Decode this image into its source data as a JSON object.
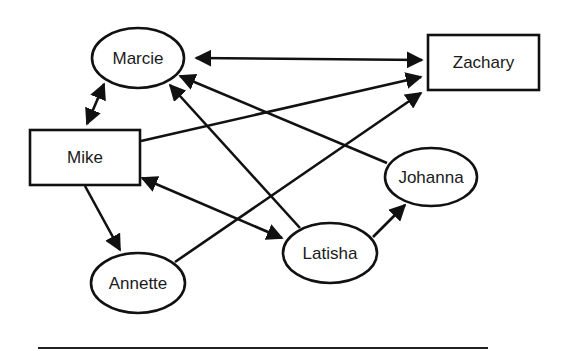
{
  "diagram": {
    "type": "directed-graph",
    "colors": {
      "stroke": "#111111",
      "text": "#1a1a1a",
      "background": "#ffffff"
    },
    "nodes": [
      {
        "id": "marcie",
        "label": "Marcie",
        "shape": "ellipse",
        "cx": 138,
        "cy": 58,
        "rx": 46,
        "ry": 30
      },
      {
        "id": "zachary",
        "label": "Zachary",
        "shape": "rect",
        "x": 428,
        "y": 35,
        "w": 111,
        "h": 55
      },
      {
        "id": "mike",
        "label": "Mike",
        "shape": "rect",
        "x": 30,
        "y": 130,
        "w": 110,
        "h": 55
      },
      {
        "id": "johanna",
        "label": "Johanna",
        "shape": "ellipse",
        "cx": 431,
        "cy": 177,
        "rx": 46,
        "ry": 29
      },
      {
        "id": "latisha",
        "label": "Latisha",
        "shape": "ellipse",
        "cx": 330,
        "cy": 253,
        "rx": 47,
        "ry": 30
      },
      {
        "id": "annette",
        "label": "Annette",
        "shape": "ellipse",
        "cx": 138,
        "cy": 283,
        "rx": 47,
        "ry": 30
      }
    ],
    "edges": [
      {
        "from": "marcie",
        "to": "zachary",
        "direction": "both",
        "x1": 196,
        "y1": 58,
        "x2": 422,
        "y2": 60
      },
      {
        "from": "mike",
        "to": "marcie",
        "direction": "both",
        "x1": 87,
        "y1": 124,
        "x2": 104,
        "y2": 84
      },
      {
        "from": "mike",
        "to": "zachary",
        "direction": "forward",
        "x1": 141,
        "y1": 141,
        "x2": 421,
        "y2": 77
      },
      {
        "from": "johanna",
        "to": "marcie",
        "direction": "forward",
        "x1": 387,
        "y1": 163,
        "x2": 180,
        "y2": 76
      },
      {
        "from": "latisha",
        "to": "marcie",
        "direction": "forward",
        "x1": 300,
        "y1": 228,
        "x2": 170,
        "y2": 85
      },
      {
        "from": "mike",
        "to": "latisha",
        "direction": "both",
        "x1": 142,
        "y1": 178,
        "x2": 282,
        "y2": 238
      },
      {
        "from": "annette",
        "to": "zachary",
        "direction": "forward",
        "x1": 175,
        "y1": 262,
        "x2": 421,
        "y2": 93
      },
      {
        "from": "mike",
        "to": "annette",
        "direction": "forward",
        "x1": 85,
        "y1": 186,
        "x2": 120,
        "y2": 250
      },
      {
        "from": "latisha",
        "to": "johanna",
        "direction": "forward",
        "x1": 373,
        "y1": 237,
        "x2": 405,
        "y2": 205
      }
    ],
    "rule": {
      "x1": 38,
      "y1": 348,
      "x2": 488,
      "y2": 348
    }
  }
}
